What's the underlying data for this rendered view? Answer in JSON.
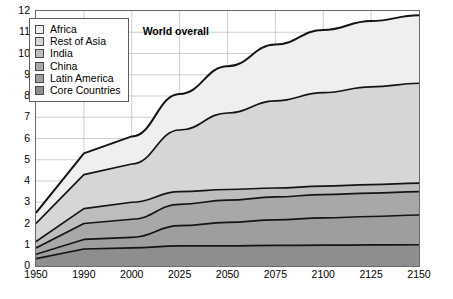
{
  "chart_data": {
    "type": "area",
    "title": "",
    "subtitle": "",
    "xlabel": "",
    "ylabel": "",
    "stacked": true,
    "grid": true,
    "legend_position": "top-left",
    "x": [
      1950,
      1990,
      2000,
      2025,
      2050,
      2075,
      2100,
      2125,
      2150
    ],
    "xtick_labels": [
      "1950",
      "1990",
      "2000",
      "2025",
      "2050",
      "2075",
      "2100",
      "2125",
      "2150"
    ],
    "xlim": [
      1950,
      2150
    ],
    "ylim": [
      0,
      12
    ],
    "ytick_labels": [
      "0",
      "1",
      "2",
      "3",
      "4",
      "5",
      "6",
      "7",
      "8",
      "9",
      "10",
      "11",
      "12"
    ],
    "yticks": [
      0,
      1,
      2,
      3,
      4,
      5,
      6,
      7,
      8,
      9,
      10,
      11,
      12
    ],
    "value_unit": "billions of people",
    "series": [
      {
        "name": "Core Countries",
        "color": "#8e8e8e",
        "values": [
          0.35,
          0.8,
          0.85,
          0.95,
          0.95,
          0.97,
          0.98,
          0.99,
          1.0
        ]
      },
      {
        "name": "Latin America",
        "color": "#9e9e9e",
        "values": [
          0.2,
          0.45,
          0.5,
          0.95,
          1.1,
          1.2,
          1.28,
          1.34,
          1.4
        ]
      },
      {
        "name": "China",
        "color": "#a8a8a8",
        "values": [
          0.3,
          0.75,
          0.85,
          1.0,
          1.05,
          1.08,
          1.1,
          1.1,
          1.1
        ]
      },
      {
        "name": "India",
        "color": "#bdbdbd",
        "values": [
          0.3,
          0.7,
          0.8,
          0.6,
          0.5,
          0.42,
          0.4,
          0.4,
          0.4
        ]
      },
      {
        "name": "Rest of Asia",
        "color": "#d6d6d6",
        "values": [
          0.85,
          1.6,
          1.8,
          2.9,
          3.6,
          4.1,
          4.4,
          4.6,
          4.7
        ]
      },
      {
        "name": "Africa",
        "color": "#efefef",
        "values": [
          0.5,
          1.0,
          1.3,
          1.7,
          2.2,
          2.65,
          2.95,
          3.1,
          3.2
        ]
      }
    ],
    "cumulative_totals": [
      2.5,
      5.3,
      6.1,
      8.1,
      9.4,
      10.42,
      11.11,
      11.53,
      11.8
    ],
    "annotations": [
      {
        "text": "World overall",
        "x": 2025,
        "y": 11.0
      }
    ]
  },
  "legend": {
    "items": [
      {
        "label": "Africa"
      },
      {
        "label": "Rest of Asia"
      },
      {
        "label": "India"
      },
      {
        "label": "China"
      },
      {
        "label": "Latin America"
      },
      {
        "label": "Core Countries"
      }
    ]
  },
  "style": {
    "plot_border": "#6a6a6a",
    "grid_color": "#b9b9b9",
    "boundary_line": "#141414",
    "background": "#ffffff"
  }
}
